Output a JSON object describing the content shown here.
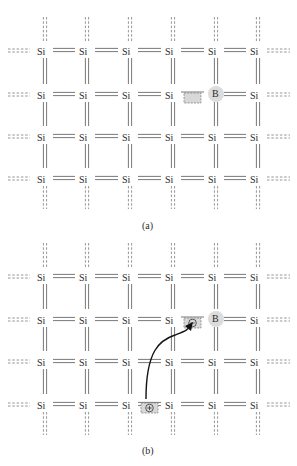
{
  "figure": {
    "panels": [
      {
        "id": "a",
        "caption": "(a)",
        "rows": [
          51,
          95,
          137,
          179
        ],
        "atoms": [
          [
            "Si",
            "Si",
            "Si",
            "Si",
            "Si",
            "Si"
          ],
          [
            "Si",
            "Si",
            "Si",
            "Si",
            "B",
            "Si"
          ],
          [
            "Si",
            "Si",
            "Si",
            "Si",
            "Si",
            "Si"
          ],
          [
            "Si",
            "Si",
            "Si",
            "Si",
            "Si",
            "Si"
          ]
        ],
        "holes": [
          {
            "row": 1,
            "between_cols": [
              3,
              4
            ],
            "sign": ""
          }
        ],
        "missing_bond": {
          "row": 1,
          "between_cols": [
            3,
            4
          ]
        }
      },
      {
        "id": "b",
        "caption": "(b)",
        "rows": [
          277,
          320,
          362,
          405
        ],
        "atoms": [
          [
            "Si",
            "Si",
            "Si",
            "Si",
            "Si",
            "Si"
          ],
          [
            "Si",
            "Si",
            "Si",
            "Si",
            "B",
            "Si"
          ],
          [
            "Si",
            "Si",
            "Si",
            "Si",
            "Si",
            "Si"
          ],
          [
            "Si",
            "Si",
            "Si",
            "Si",
            "Si",
            "Si"
          ]
        ],
        "holes": [
          {
            "row": 1,
            "between_cols": [
              3,
              4
            ],
            "sign": "⊖"
          },
          {
            "row": 3,
            "between_cols": [
              2,
              3
            ],
            "sign": "⊕"
          }
        ],
        "missing_bond": {
          "row": 1,
          "between_cols": [
            3,
            4
          ]
        },
        "arrow": {
          "from": "plus-hole",
          "to": "minus-hole"
        }
      }
    ],
    "columns": [
      42,
      84,
      127,
      170,
      213,
      255
    ],
    "dopant_label": "B",
    "host_label": "Si",
    "colors": {
      "bond": "#6a6a6a",
      "boron_fill": "#dcdcdc",
      "hole_fill": "#d8d8d8",
      "text": "#2a2a2a"
    }
  }
}
